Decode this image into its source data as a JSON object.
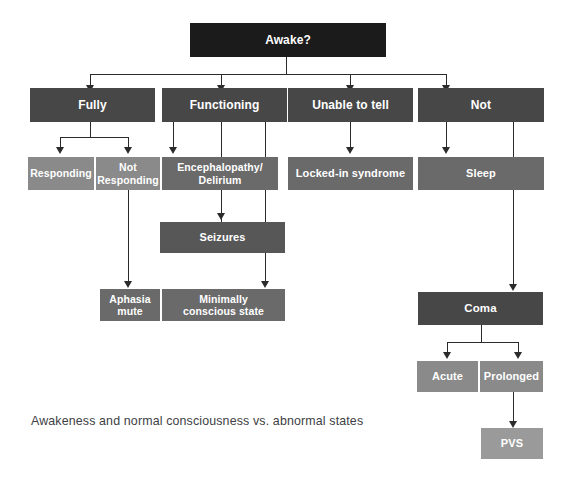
{
  "diagram": {
    "caption": "Awakeness and normal consciousness vs. abnormal states",
    "colors": {
      "root_box": "#1b1b1b",
      "level2_box": "#474747",
      "level3_box": "#6a6a6a",
      "seizures_box": "#575757",
      "coma_box": "#474747",
      "pvs_box": "#9a9a9a",
      "connector": "#2b2b2b",
      "label_text": "#ffffff",
      "caption_text": "#3d4044",
      "background": "#ffffff"
    },
    "nodes": {
      "awake": "Awake?",
      "fully": "Fully",
      "functioning": "Functioning",
      "unable_to_tell": "Unable to tell",
      "not": "Not",
      "responding": "Responding",
      "not_responding": "Not\nResponding",
      "encephalopathy": "Encephalopathy/\nDelirium",
      "locked_in": "Locked-in syndrome",
      "sleep": "Sleep",
      "seizures": "Seizures",
      "aphasia_mute": "Aphasia\nmute",
      "minimally_conscious": "Minimally\nconscious state",
      "coma": "Coma",
      "acute": "Acute",
      "prolonged": "Prolonged",
      "pvs": "PVS"
    }
  }
}
